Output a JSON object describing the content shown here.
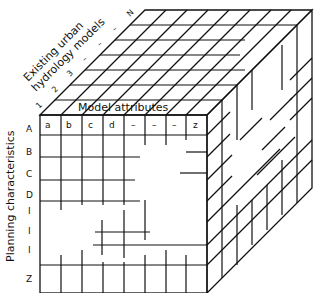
{
  "diagram": {
    "type": "3D matrix cube",
    "axes": {
      "depth_label_line1": "Existing urban",
      "depth_label_line2": "hydrology models",
      "depth_ticks": [
        "1",
        "2",
        "3",
        "–",
        "–",
        "–",
        "N"
      ],
      "top_label": "Model attributes",
      "column_labels": [
        "a",
        "b",
        "c",
        "d",
        "–",
        "–",
        "–",
        "z"
      ],
      "vertical_label": "Planning characteristics",
      "row_labels": [
        "A",
        "B",
        "C",
        "D",
        "I",
        "I",
        "I",
        "Z"
      ]
    },
    "colors": {
      "ink": "#111111",
      "background": "#ffffff"
    }
  }
}
